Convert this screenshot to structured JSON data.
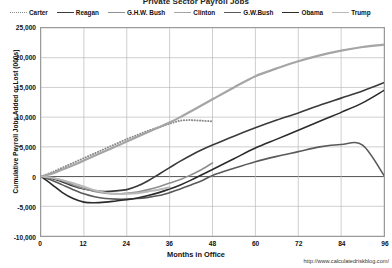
{
  "chart_data": {
    "type": "line",
    "title": "Private Sector Payroll Jobs",
    "xlabel": "Months in Office",
    "ylabel": "Cumulative Payroll Jobs Added or Lost (000s)",
    "source": "http://www.calculatedriskblog.com/",
    "xlim": [
      0,
      96
    ],
    "ylim": [
      -10000,
      25000
    ],
    "xticks": [
      0,
      12,
      24,
      36,
      48,
      60,
      72,
      84,
      96
    ],
    "xtick_labels": [
      "0",
      "12",
      "24",
      "36",
      "48",
      "60",
      "72",
      "84",
      "96"
    ],
    "yticks": [
      25000,
      20000,
      15000,
      10000,
      5000,
      0,
      -5000,
      -10000
    ],
    "ytick_labels": [
      "25,000",
      "20,000",
      "15,000",
      "10,000",
      "5,000",
      "0",
      "-5,000",
      "-10,000"
    ],
    "grid": true,
    "legend_position": "top",
    "series": [
      {
        "name": "Carter",
        "style": "dotted",
        "color": "#8a8a8a",
        "width": 2.0,
        "x": [
          0,
          3,
          6,
          9,
          12,
          15,
          18,
          21,
          24,
          27,
          30,
          33,
          36,
          39,
          42,
          45,
          48
        ],
        "values": [
          0,
          700,
          1500,
          2300,
          3100,
          3900,
          4700,
          5500,
          6300,
          7000,
          7700,
          8300,
          8900,
          9400,
          9500,
          9400,
          9300
        ]
      },
      {
        "name": "Reagan",
        "style": "solid",
        "color": "#3a3a3a",
        "width": 1.6,
        "x": [
          0,
          3,
          6,
          9,
          12,
          15,
          18,
          21,
          24,
          27,
          30,
          33,
          36,
          39,
          42,
          45,
          48,
          54,
          60,
          66,
          72,
          78,
          84,
          90,
          96
        ],
        "values": [
          0,
          -300,
          -900,
          -1600,
          -2100,
          -2400,
          -2500,
          -2400,
          -2200,
          -1600,
          -700,
          400,
          1500,
          2600,
          3600,
          4500,
          5300,
          6800,
          8200,
          9500,
          10700,
          12000,
          13200,
          14400,
          15800
        ]
      },
      {
        "name": "G.H.W. Bush",
        "style": "solid",
        "color": "#8f8f8f",
        "width": 1.6,
        "x": [
          0,
          3,
          6,
          9,
          12,
          15,
          18,
          21,
          24,
          27,
          30,
          33,
          36,
          39,
          42,
          45,
          48
        ],
        "values": [
          0,
          -200,
          -700,
          -1400,
          -2000,
          -2500,
          -2800,
          -2900,
          -2800,
          -2600,
          -2200,
          -1700,
          -1100,
          -500,
          300,
          1200,
          2300
        ]
      },
      {
        "name": "Clinton",
        "style": "solid",
        "color": "#a5a5a5",
        "width": 2.2,
        "x": [
          0,
          3,
          6,
          9,
          12,
          15,
          18,
          21,
          24,
          27,
          30,
          33,
          36,
          39,
          42,
          45,
          48,
          54,
          60,
          66,
          72,
          78,
          84,
          90,
          96
        ],
        "values": [
          0,
          500,
          1200,
          1900,
          2700,
          3500,
          4300,
          5100,
          5900,
          6700,
          7500,
          8300,
          9100,
          10000,
          11000,
          12000,
          13000,
          15000,
          16900,
          18200,
          19400,
          20400,
          21200,
          21800,
          22200
        ]
      },
      {
        "name": "G.W.Bush",
        "style": "solid",
        "color": "#5a5a5a",
        "width": 1.6,
        "x": [
          0,
          3,
          6,
          9,
          12,
          15,
          18,
          21,
          24,
          27,
          30,
          33,
          36,
          39,
          42,
          45,
          48,
          54,
          60,
          66,
          72,
          78,
          84,
          90,
          96
        ],
        "values": [
          0,
          -600,
          -1400,
          -2200,
          -2900,
          -3400,
          -3700,
          -3800,
          -3800,
          -3700,
          -3500,
          -3200,
          -2700,
          -2100,
          -1400,
          -700,
          200,
          1400,
          2500,
          3400,
          4200,
          5000,
          5400,
          5300,
          200
        ]
      },
      {
        "name": "Obama",
        "style": "solid",
        "color": "#2b2b2b",
        "width": 1.6,
        "x": [
          0,
          3,
          6,
          9,
          12,
          15,
          18,
          21,
          24,
          27,
          30,
          33,
          36,
          39,
          42,
          45,
          48,
          54,
          60,
          66,
          72,
          78,
          84,
          90,
          96
        ],
        "values": [
          0,
          -1300,
          -2700,
          -3700,
          -4300,
          -4400,
          -4300,
          -4100,
          -3900,
          -3600,
          -3200,
          -2700,
          -2100,
          -1400,
          -600,
          300,
          1200,
          3000,
          4800,
          6300,
          7800,
          9300,
          10800,
          12400,
          14500
        ]
      },
      {
        "name": "Trump",
        "style": "solid",
        "color": "#b8b8b8",
        "width": 2.0,
        "x": [
          0,
          3,
          6,
          9,
          12,
          15,
          18,
          21,
          24,
          27,
          30,
          33,
          36
        ],
        "values": [
          0,
          -200,
          -600,
          -1100,
          -1700,
          -2300,
          -2700,
          -2900,
          -2900,
          -2800,
          -2500,
          -2200,
          -1800
        ]
      }
    ]
  },
  "legend": {
    "items": [
      {
        "label": "Carter"
      },
      {
        "label": "Reagan"
      },
      {
        "label": "G.H.W. Bush"
      },
      {
        "label": "Clinton"
      },
      {
        "label": "G.W.Bush"
      },
      {
        "label": "Obama"
      },
      {
        "label": "Trump"
      }
    ]
  }
}
